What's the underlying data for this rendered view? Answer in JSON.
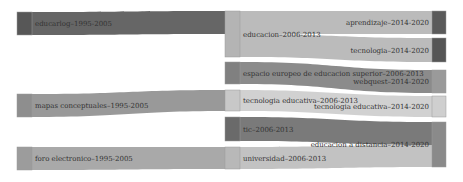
{
  "diagram": {
    "type": "sankey",
    "columns": [
      "1995-2005",
      "2006-2013",
      "2014-2020"
    ],
    "nodes": [
      {
        "id": "educarlog",
        "label": "educarlog–1995-2005",
        "x": 17,
        "y": 12,
        "w": 15,
        "h": 23,
        "color": "#575757",
        "label_side": "right"
      },
      {
        "id": "mapas",
        "label": "mapas conceptuales–1995-2005",
        "x": 17,
        "y": 94,
        "w": 15,
        "h": 23,
        "color": "#8e8e8e",
        "label_side": "right"
      },
      {
        "id": "foro",
        "label": "foro electronico–1995-2005",
        "x": 17,
        "y": 147,
        "w": 15,
        "h": 23,
        "color": "#9c9c9c",
        "label_side": "right"
      },
      {
        "id": "educacion",
        "label": "educacion–2006-2013",
        "x": 225,
        "y": 11,
        "w": 15,
        "h": 46,
        "color": "#b4b4b4",
        "label_side": "right"
      },
      {
        "id": "espacio",
        "label": "espacio europeo de educacion superior–2006-2013",
        "x": 225,
        "y": 62,
        "w": 15,
        "h": 22,
        "color": "#808080",
        "label_side": "right"
      },
      {
        "id": "tecedu1",
        "label": "tecnologia educativa–2006-2013",
        "x": 225,
        "y": 90,
        "w": 15,
        "h": 21,
        "color": "#c8c8c8",
        "label_side": "right"
      },
      {
        "id": "tic",
        "label": "tic–2006-2013",
        "x": 225,
        "y": 117,
        "w": 15,
        "h": 24,
        "color": "#6a6a6a",
        "label_side": "right"
      },
      {
        "id": "universidad",
        "label": "universidad–2006-2013",
        "x": 225,
        "y": 147,
        "w": 15,
        "h": 22,
        "color": "#b8b8b8",
        "label_side": "right"
      },
      {
        "id": "aprendizaje",
        "label": "aprendizaje–2014-2020",
        "x": 432,
        "y": 11,
        "w": 14,
        "h": 23,
        "color": "#5a5a5a",
        "label_side": "left"
      },
      {
        "id": "tecnologia",
        "label": "tecnologia–2014-2020",
        "x": 432,
        "y": 38,
        "w": 14,
        "h": 24,
        "color": "#555555",
        "label_side": "left"
      },
      {
        "id": "webquest",
        "label": "webquest–2014-2020",
        "x": 432,
        "y": 70,
        "w": 14,
        "h": 23,
        "color": "#9a9a9a",
        "label_side": "left"
      },
      {
        "id": "tecedu2",
        "label": "tecnologia educativa–2014-2020",
        "x": 432,
        "y": 96,
        "w": 14,
        "h": 21,
        "color": "#cfcfcf",
        "label_side": "left"
      },
      {
        "id": "distancia",
        "label": "educacion a distancia–2014-2020",
        "x": 432,
        "y": 122,
        "w": 14,
        "h": 45,
        "color": "#8a8a8a",
        "label_side": "left"
      }
    ],
    "links": [
      {
        "source": "educarlog",
        "target": "educacion",
        "sy0": 12,
        "sy1": 35,
        "ty0": 11,
        "ty1": 34,
        "color": "#555555"
      },
      {
        "source": "mapas",
        "target": "tecedu1",
        "sy0": 94,
        "sy1": 117,
        "ty0": 90,
        "ty1": 111,
        "color": "#8e8e8e"
      },
      {
        "source": "foro",
        "target": "universidad",
        "sy0": 147,
        "sy1": 170,
        "ty0": 147,
        "ty1": 169,
        "color": "#a0a0a0"
      },
      {
        "source": "educacion",
        "target": "aprendizaje",
        "sy0": 11,
        "sy1": 34,
        "ty0": 11,
        "ty1": 34,
        "color": "#b4b4b4"
      },
      {
        "source": "educacion",
        "target": "tecnologia",
        "sy0": 34,
        "sy1": 57,
        "ty0": 38,
        "ty1": 62,
        "color": "#b4b4b4"
      },
      {
        "source": "espacio",
        "target": "webquest",
        "sy0": 62,
        "sy1": 84,
        "ty0": 70,
        "ty1": 93,
        "color": "#7e7e7e"
      },
      {
        "source": "tecedu1",
        "target": "tecedu2",
        "sy0": 90,
        "sy1": 111,
        "ty0": 96,
        "ty1": 117,
        "color": "#cccccc"
      },
      {
        "source": "tic",
        "target": "distancia",
        "sy0": 117,
        "sy1": 141,
        "ty0": 122,
        "ty1": 145,
        "color": "#6c6c6c"
      },
      {
        "source": "universidad",
        "target": "distancia",
        "sy0": 147,
        "sy1": 169,
        "ty0": 145,
        "ty1": 167,
        "color": "#bbbbbb"
      }
    ]
  }
}
